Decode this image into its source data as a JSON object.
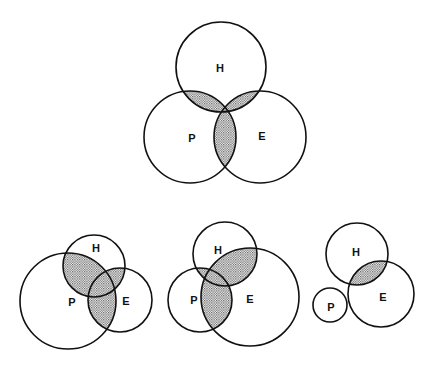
{
  "colors": {
    "stroke": "#111111",
    "shade": "#8a8a8a",
    "background": "#ffffff"
  },
  "diagrams": [
    {
      "name": "venn-top",
      "circles": [
        {
          "id": "H",
          "label": "H",
          "cx": 221,
          "cy": 67,
          "r": 45
        },
        {
          "id": "P",
          "label": "P",
          "cx": 190,
          "cy": 137,
          "r": 46
        },
        {
          "id": "E",
          "label": "E",
          "cx": 260,
          "cy": 137,
          "r": 46
        }
      ],
      "shaded_pairs": [
        [
          "H",
          "P"
        ],
        [
          "H",
          "E"
        ],
        [
          "P",
          "E"
        ]
      ],
      "label_positions": {
        "H": [
          220,
          68
        ],
        "P": [
          192,
          138
        ],
        "E": [
          262,
          136
        ]
      }
    },
    {
      "name": "venn-bottom-left",
      "circles": [
        {
          "id": "H",
          "label": "H",
          "cx": 94,
          "cy": 266,
          "r": 31
        },
        {
          "id": "P",
          "label": "P",
          "cx": 68,
          "cy": 301,
          "r": 48
        },
        {
          "id": "E",
          "label": "E",
          "cx": 120,
          "cy": 300,
          "r": 32
        }
      ],
      "shaded_pairs": [
        [
          "H",
          "P"
        ],
        [
          "H",
          "E"
        ],
        [
          "P",
          "E"
        ]
      ],
      "label_positions": {
        "H": [
          96,
          248
        ],
        "P": [
          72,
          302
        ],
        "E": [
          126,
          301
        ]
      }
    },
    {
      "name": "venn-bottom-middle",
      "circles": [
        {
          "id": "H",
          "label": "H",
          "cx": 225,
          "cy": 254,
          "r": 32
        },
        {
          "id": "P",
          "label": "P",
          "cx": 200,
          "cy": 300,
          "r": 32
        },
        {
          "id": "E",
          "label": "E",
          "cx": 250,
          "cy": 297,
          "r": 49
        }
      ],
      "shaded_pairs": [
        [
          "H",
          "P"
        ],
        [
          "H",
          "E"
        ],
        [
          "P",
          "E"
        ]
      ],
      "label_positions": {
        "H": [
          218,
          250
        ],
        "P": [
          194,
          300
        ],
        "E": [
          250,
          299
        ]
      }
    },
    {
      "name": "venn-bottom-right",
      "circles": [
        {
          "id": "H",
          "label": "H",
          "cx": 357,
          "cy": 254,
          "r": 31
        },
        {
          "id": "P",
          "label": "P",
          "cx": 330,
          "cy": 305,
          "r": 17
        },
        {
          "id": "E",
          "label": "E",
          "cx": 381,
          "cy": 294,
          "r": 33
        }
      ],
      "shaded_pairs": [
        [
          "H",
          "E"
        ]
      ],
      "label_positions": {
        "H": [
          356,
          252
        ],
        "P": [
          331,
          307
        ],
        "E": [
          383,
          297
        ]
      }
    }
  ]
}
